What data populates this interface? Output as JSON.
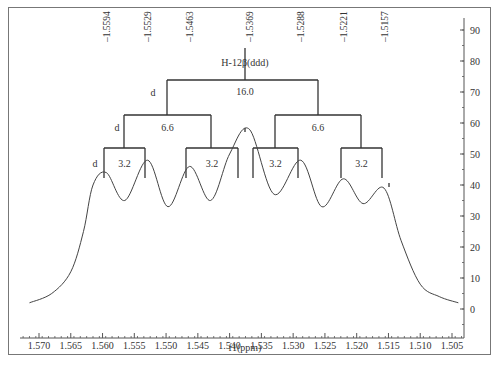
{
  "chart_data": {
    "type": "line",
    "title": "",
    "xlabel": "f1(ppm)",
    "ylabel": "",
    "xlim": [
      1.5725,
      1.5035
    ],
    "x_reversed": true,
    "ylim": [
      -10,
      95
    ],
    "x_ticks": [
      "1.570",
      "1.565",
      "1.560",
      "1.555",
      "1.550",
      "1.545",
      "1.540",
      "1.535",
      "1.530",
      "1.525",
      "1.520",
      "1.515",
      "1.510",
      "1.505"
    ],
    "y_ticks": [
      "0",
      "10",
      "20",
      "30",
      "40",
      "50",
      "60",
      "70",
      "80",
      "90"
    ],
    "y_axis_position": "right",
    "grid": false,
    "peak_labels": [
      "-1.5594",
      "-1.5529",
      "-1.5463",
      "-1.5369",
      "-1.5288",
      "-1.5221",
      "-1.5157"
    ],
    "peaks": [
      {
        "ppm": 1.5594,
        "intensity": 44
      },
      {
        "ppm": 1.5529,
        "intensity": 48
      },
      {
        "ppm": 1.5463,
        "intensity": 46
      },
      {
        "ppm": 1.5369,
        "intensity": 58
      },
      {
        "ppm": 1.5288,
        "intensity": 48
      },
      {
        "ppm": 1.5221,
        "intensity": 42
      },
      {
        "ppm": 1.5157,
        "intensity": 39
      }
    ],
    "valleys": [
      {
        "ppm": 1.5565,
        "intensity": 35
      },
      {
        "ppm": 1.5497,
        "intensity": 33
      },
      {
        "ppm": 1.543,
        "intensity": 35
      },
      {
        "ppm": 1.533,
        "intensity": 37
      },
      {
        "ppm": 1.5255,
        "intensity": 33
      },
      {
        "ppm": 1.519,
        "intensity": 34
      }
    ],
    "series": [
      {
        "name": "spectrum",
        "x": [
          1.5715,
          1.568,
          1.565,
          1.563,
          1.5615,
          1.5594,
          1.5565,
          1.5529,
          1.5497,
          1.5463,
          1.543,
          1.54,
          1.5369,
          1.533,
          1.5288,
          1.5255,
          1.5221,
          1.519,
          1.5157,
          1.513,
          1.51,
          1.507,
          1.504
        ],
        "values": [
          2,
          5,
          12,
          25,
          40,
          44,
          35,
          48,
          33,
          46,
          35,
          50,
          58,
          37,
          48,
          33,
          42,
          34,
          39,
          22,
          8,
          4,
          2
        ]
      }
    ],
    "annotations": {
      "multiplet_label": "H-12β(ddd)",
      "couplings": [
        {
          "level": 1,
          "label": "d",
          "J": "16.0"
        },
        {
          "level": 2,
          "label": "d",
          "J_left": "6.6",
          "J_right": "6.6"
        },
        {
          "level": 3,
          "label": "d",
          "J": [
            "3.2",
            "3.2",
            "3.2",
            "3.2"
          ]
        }
      ]
    }
  },
  "labels": {
    "multiplet": "H-12β(ddd)",
    "d": "d",
    "j1": "16.0",
    "j2": "6.6",
    "j3": "3.2",
    "xlabel": "f1(ppm)"
  }
}
